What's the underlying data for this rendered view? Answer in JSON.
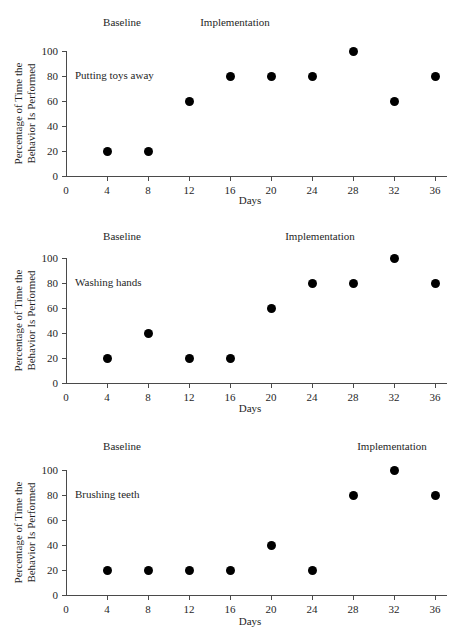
{
  "figure": {
    "shared": {
      "x_title": "Days",
      "y_title_line1": "Percentage of Time the",
      "y_title_line2": "Behavior Is Performed",
      "x_ticks": [
        "0",
        "4",
        "8",
        "12",
        "16",
        "20",
        "24",
        "28",
        "32",
        "36"
      ],
      "y_ticks": [
        "0",
        "20",
        "40",
        "60",
        "80",
        "100"
      ],
      "phase_baseline": "Baseline",
      "phase_implementation": "Implementation",
      "marker_color": "#000000",
      "axis_color": "#4a4a4a",
      "text_color": "#1f1f1f",
      "background": "#ffffff"
    },
    "panels": [
      {
        "behavior": "Putting toys away"
      },
      {
        "behavior": "Washing hands"
      },
      {
        "behavior": "Brushing teeth"
      }
    ]
  },
  "chart_data": [
    {
      "type": "scatter",
      "title": "Putting toys away",
      "xlabel": "Days",
      "ylabel": "Percentage of Time the Behavior Is Performed",
      "x": [
        4,
        8,
        12,
        16,
        20,
        24,
        28,
        32,
        36
      ],
      "values": [
        20,
        20,
        60,
        80,
        80,
        80,
        100,
        60,
        80
      ],
      "xlim": [
        0,
        38
      ],
      "ylim": [
        0,
        100
      ],
      "xticks": [
        0,
        4,
        8,
        12,
        16,
        20,
        24,
        28,
        32,
        36
      ],
      "yticks": [
        0,
        20,
        40,
        60,
        80,
        100
      ],
      "grid": false,
      "legend": "none",
      "annotations": [
        {
          "text": "Baseline",
          "x": 8,
          "position": "above-axis"
        },
        {
          "text": "Implementation",
          "x": 18,
          "position": "above-axis"
        },
        {
          "text": "Putting toys away",
          "x": 2,
          "y": 80,
          "position": "in-plot"
        }
      ],
      "phase_change_after_day": 8
    },
    {
      "type": "scatter",
      "title": "Washing hands",
      "xlabel": "Days",
      "ylabel": "Percentage of Time the Behavior Is Performed",
      "x": [
        4,
        8,
        12,
        16,
        20,
        24,
        28,
        32,
        36
      ],
      "values": [
        20,
        40,
        20,
        20,
        60,
        80,
        80,
        100,
        80
      ],
      "xlim": [
        0,
        38
      ],
      "ylim": [
        0,
        100
      ],
      "xticks": [
        0,
        4,
        8,
        12,
        16,
        20,
        24,
        28,
        32,
        36
      ],
      "yticks": [
        0,
        20,
        40,
        60,
        80,
        100
      ],
      "grid": false,
      "legend": "none",
      "annotations": [
        {
          "text": "Baseline",
          "x": 8,
          "position": "above-axis"
        },
        {
          "text": "Implementation",
          "x": 26,
          "position": "above-axis"
        },
        {
          "text": "Washing hands",
          "x": 2,
          "y": 80,
          "position": "in-plot"
        }
      ],
      "phase_change_after_day": 16
    },
    {
      "type": "scatter",
      "title": "Brushing teeth",
      "xlabel": "Days",
      "ylabel": "Percentage of Time the Behavior Is Performed",
      "x": [
        4,
        8,
        12,
        16,
        20,
        24,
        28,
        32,
        36
      ],
      "values": [
        20,
        20,
        20,
        20,
        40,
        20,
        80,
        100,
        80
      ],
      "xlim": [
        0,
        38
      ],
      "ylim": [
        0,
        100
      ],
      "xticks": [
        0,
        4,
        8,
        12,
        16,
        20,
        24,
        28,
        32,
        36
      ],
      "yticks": [
        0,
        20,
        40,
        60,
        80,
        100
      ],
      "grid": false,
      "legend": "none",
      "annotations": [
        {
          "text": "Baseline",
          "x": 8,
          "position": "above-axis"
        },
        {
          "text": "Implementation",
          "x": 33,
          "position": "above-axis"
        },
        {
          "text": "Brushing teeth",
          "x": 2,
          "y": 80,
          "position": "in-plot"
        }
      ],
      "phase_change_after_day": 24
    }
  ]
}
